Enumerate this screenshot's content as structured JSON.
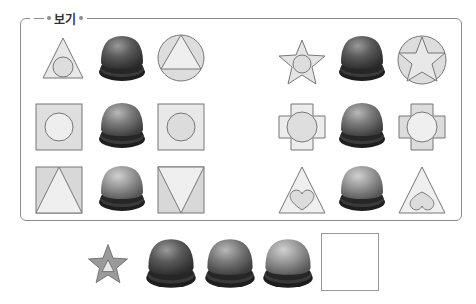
{
  "frame": {
    "title": "보기"
  },
  "example_rows": [
    {
      "left": {
        "input": "triangle-with-inner-circle",
        "button_shade": "dark",
        "output": "circle-with-inner-triangle"
      },
      "right": {
        "input": "star-with-inner-circle",
        "button_shade": "dark",
        "output": "circle-with-inner-star"
      }
    },
    {
      "left": {
        "input": "square-with-inner-circle",
        "button_shade": "medium",
        "output": "square-with-inner-circle-shaded"
      },
      "right": {
        "input": "cross-with-inner-circle",
        "button_shade": "medium",
        "output": "cross-with-inner-circle-shaded"
      }
    },
    {
      "left": {
        "input": "square-with-upright-triangle",
        "button_shade": "light",
        "output": "square-with-inverted-triangle"
      },
      "right": {
        "input": "triangle-with-heart",
        "button_shade": "light",
        "output": "triangle-with-inverted-heart"
      }
    }
  ],
  "question": {
    "input": "dark-star-with-inner-triangle",
    "buttons": [
      "dark",
      "medium",
      "light"
    ],
    "answer_box": ""
  },
  "colors": {
    "shape_fill": "#e4e4e4",
    "shape_stroke": "#7a7a7a",
    "button_dark": "#4a4a4a",
    "button_medium": "#6a6a6a",
    "button_light": "#8c8c8c",
    "frame_border": "#8c8c8c"
  }
}
